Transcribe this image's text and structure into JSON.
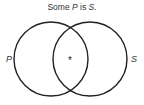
{
  "title": {
    "prefix": "Some ",
    "subject": "P",
    "middle": " is ",
    "predicate": "S",
    "suffix": "."
  },
  "diagram": {
    "type": "venn",
    "circles": [
      {
        "label": "P",
        "cx": 51,
        "cy": 59,
        "r": 37
      },
      {
        "label": "S",
        "cx": 90,
        "cy": 59,
        "r": 37
      }
    ],
    "mark": {
      "symbol": "*",
      "region": "intersection"
    },
    "stroke_color": "#222222"
  }
}
